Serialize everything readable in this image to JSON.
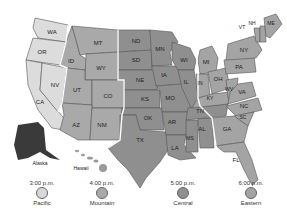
{
  "map": {
    "title": "US Time Zones",
    "states": [
      "WA",
      "OR",
      "CA",
      "ID",
      "NV",
      "MT",
      "WY",
      "UT",
      "CO",
      "AZ",
      "NM",
      "ND",
      "SD",
      "NE",
      "KS",
      "OK",
      "TX",
      "MN",
      "IA",
      "MO",
      "AR",
      "LA",
      "WI",
      "IL",
      "MS",
      "AL",
      "TN",
      "MI",
      "IN",
      "KY",
      "OH",
      "GA",
      "FL",
      "SC",
      "NC",
      "VA",
      "WV",
      "PA",
      "NY",
      "VT",
      "NH",
      "ME"
    ],
    "labels": {
      "WA": "WA",
      "OR": "OR",
      "CA": "CA",
      "ID": "ID",
      "NV": "NV",
      "MT": "MT",
      "WY": "WY",
      "UT": "UT",
      "CO": "CO",
      "AZ": "AZ",
      "NM": "NM",
      "ND": "ND",
      "SD": "SD",
      "NE": "NE",
      "KS": "KS",
      "OK": "OK",
      "TX": "TX",
      "MN": "MN",
      "IA": "IA",
      "MO": "MO",
      "AR": "AR",
      "LA": "LA",
      "WI": "WI",
      "IL": "IL",
      "MS": "MS",
      "AL": "AL",
      "TN": "TN",
      "MI": "MI",
      "IN": "IN",
      "KY": "KY",
      "OH": "OH",
      "GA": "GA",
      "FL": "FL",
      "SC": "SC",
      "NC": "NC",
      "VA": "VA",
      "WV": "WV",
      "PA": "PA",
      "NY": "NY",
      "VT": "VT",
      "NH": "NH",
      "ME": "ME",
      "alaska": "Alaska",
      "hawaii": "Hawaii"
    },
    "colors": {
      "pacific": "#dcdcdc",
      "mountain": "#a9a9a9",
      "central": "#8f8f8f",
      "eastern": "#a4a4a4",
      "alaska": "#3a3a3a"
    }
  },
  "legend": [
    {
      "time": "3:00 p.m.",
      "zone": "Pacific",
      "color": "#d8d8d8"
    },
    {
      "time": "4:00 p.m.",
      "zone": "Mountain",
      "color": "#a9a9a9"
    },
    {
      "time": "5:00 p.m.",
      "zone": "Central",
      "color": "#8f8f8f"
    },
    {
      "time": "6:00 p.m.",
      "zone": "Eastern",
      "color": "#a4a4a4"
    }
  ]
}
